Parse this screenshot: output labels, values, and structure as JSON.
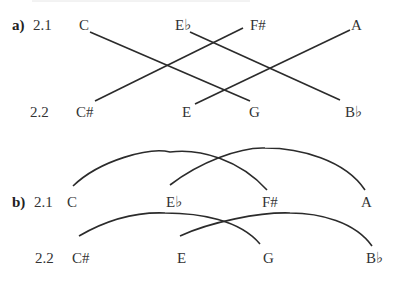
{
  "header": {
    "clipped_text": ""
  },
  "part_a": {
    "label": "a)",
    "row1": {
      "label": "2.1",
      "notes": [
        "C",
        "E♭",
        "F#",
        "A"
      ]
    },
    "row2": {
      "label": "2.2",
      "notes": [
        "C#",
        "E",
        "G",
        "B♭"
      ]
    },
    "connections": [
      {
        "from": "C",
        "to": "G",
        "style": "straight"
      },
      {
        "from": "C#",
        "to": "F#",
        "style": "straight"
      },
      {
        "from": "E♭",
        "to": "B♭",
        "style": "straight"
      },
      {
        "from": "E",
        "to": "A",
        "style": "straight"
      }
    ]
  },
  "part_b": {
    "label": "b)",
    "row1": {
      "label": "2.1",
      "notes": [
        "C",
        "E♭",
        "F#",
        "A"
      ]
    },
    "row2": {
      "label": "2.2",
      "notes": [
        "C#",
        "E",
        "G",
        "B♭"
      ]
    },
    "connections": [
      {
        "from": "C",
        "to": "F#",
        "style": "arc"
      },
      {
        "from": "E♭",
        "to": "A",
        "style": "arc"
      },
      {
        "from": "C#",
        "to": "G",
        "style": "arc"
      },
      {
        "from": "E",
        "to": "B♭",
        "style": "arc"
      }
    ]
  }
}
